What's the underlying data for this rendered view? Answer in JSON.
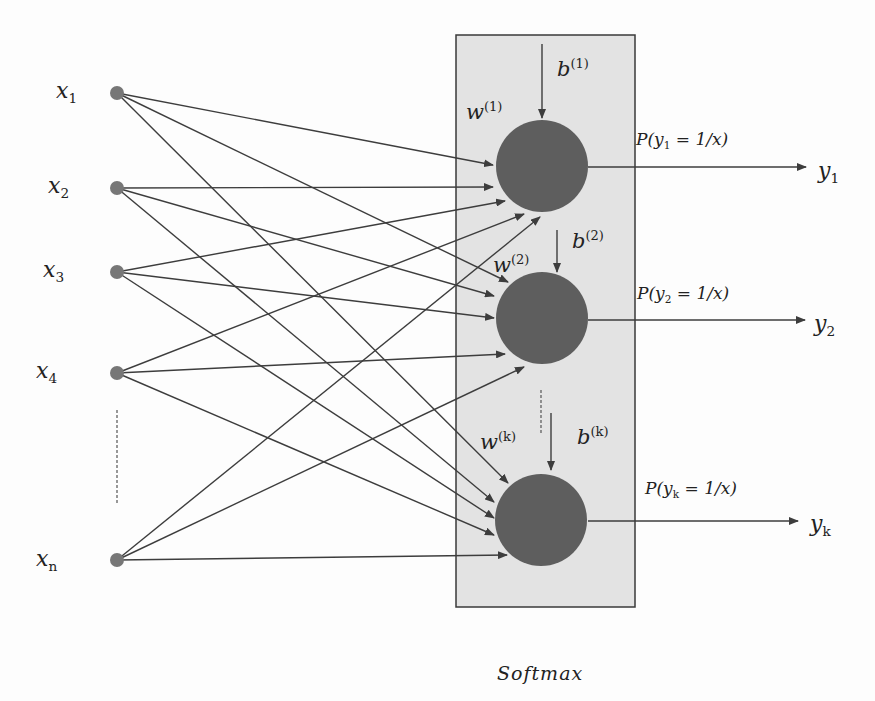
{
  "colors": {
    "background": "#fdfdfd",
    "box_fill": "#e3e3e3",
    "box_stroke": "#3a3a3a",
    "node_fill": "#5e5e5e",
    "input_node_fill": "#777777",
    "line": "#3d3d3d",
    "text": "#222222"
  },
  "softmax_box": {
    "x": 456,
    "y": 35,
    "width": 179,
    "height": 572,
    "caption": "Softmax",
    "caption_pos": [
      497,
      664
    ]
  },
  "inputs": [
    {
      "id": "x1",
      "var": "x",
      "sub": "1",
      "cx": 117,
      "cy": 93,
      "label_pos": [
        56,
        80
      ]
    },
    {
      "id": "x2",
      "var": "x",
      "sub": "2",
      "cx": 117,
      "cy": 188,
      "label_pos": [
        48,
        175
      ]
    },
    {
      "id": "x3",
      "var": "x",
      "sub": "3",
      "cx": 117,
      "cy": 272,
      "label_pos": [
        43,
        259
      ]
    },
    {
      "id": "x4",
      "var": "x",
      "sub": "4",
      "cx": 117,
      "cy": 373,
      "label_pos": [
        36,
        360
      ]
    },
    {
      "id": "xn",
      "var": "x",
      "sub": "n",
      "cx": 117,
      "cy": 560,
      "label_pos": [
        36,
        548
      ]
    }
  ],
  "input_ellipsis": {
    "x": 117,
    "y1": 410,
    "y2": 503
  },
  "input_node_radius": 7,
  "neurons": [
    {
      "id": "n1",
      "cx": 542,
      "cy": 166,
      "r": 46,
      "weight": {
        "var": "w",
        "sup": "(1)",
        "pos": [
          466,
          100
        ]
      },
      "bias": {
        "var": "b",
        "sup": "(1)",
        "pos": [
          557,
          57
        ],
        "arrow": [
          542,
          44,
          542,
          118
        ]
      },
      "output": {
        "prob_text_a": "P(y",
        "prob_sub": "1",
        "prob_text_b": " = 1/x)",
        "prob_pos": [
          636,
          131
        ],
        "arrow": [
          588,
          167,
          806,
          167
        ],
        "y_var": "y",
        "y_sub": "1",
        "y_pos": [
          818,
          160
        ]
      },
      "inputs_end": [
        [
          493,
          165
        ],
        [
          493,
          187
        ],
        [
          505,
          201
        ],
        [
          524,
          214
        ],
        [
          540,
          217
        ]
      ]
    },
    {
      "id": "n2",
      "cx": 542,
      "cy": 318,
      "r": 46,
      "weight": {
        "var": "w",
        "sup": "(2)",
        "pos": [
          493,
          253
        ]
      },
      "bias": {
        "var": "b",
        "sup": "(2)",
        "pos": [
          572,
          229
        ]
      },
      "bias_arrow": [
        557,
        230,
        557,
        272
      ],
      "output": {
        "prob_text_a": "P(y",
        "prob_sub": "2",
        "prob_text_b": " = 1/x)",
        "prob_pos": [
          637,
          285
        ],
        "arrow": [
          588,
          320,
          805,
          320
        ],
        "y_var": "y",
        "y_sub": "2",
        "y_pos": [
          814,
          313
        ]
      },
      "inputs_end": [
        [
          508,
          282
        ],
        [
          494,
          296
        ],
        [
          494,
          318
        ],
        [
          505,
          354
        ],
        [
          524,
          367
        ]
      ]
    },
    {
      "id": "nk",
      "cx": 541,
      "cy": 520,
      "r": 46,
      "weight": {
        "var": "w",
        "sup": "(k)",
        "pos": [
          480,
          430
        ]
      },
      "bias": {
        "var": "b",
        "sup": "(k)",
        "pos": [
          577,
          425
        ]
      },
      "bias_arrow": [
        551,
        413,
        551,
        470
      ],
      "output": {
        "prob_text_a": "P(y",
        "prob_sub": "k",
        "prob_text_b": " = 1/x)",
        "prob_pos": [
          645,
          480
        ],
        "arrow": [
          588,
          521,
          798,
          521
        ],
        "y_var": "y",
        "y_sub": "k",
        "y_pos": [
          810,
          513
        ]
      },
      "inputs_end": [
        [
          508,
          483
        ],
        [
          494,
          502
        ],
        [
          494,
          518
        ],
        [
          494,
          535
        ],
        [
          507,
          555
        ]
      ]
    }
  ],
  "neuron_ellipsis": {
    "x": 541,
    "y1": 390,
    "y2": 435
  }
}
